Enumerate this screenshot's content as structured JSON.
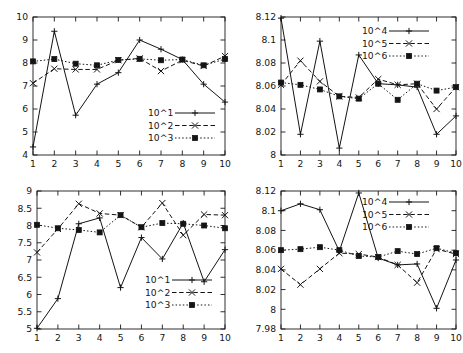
{
  "figure": {
    "title": "",
    "panel_count": 4
  },
  "chart_data": [
    {
      "id": "top-left",
      "type": "line",
      "title": "",
      "xlabel": "",
      "ylabel": "",
      "x": [
        1,
        2,
        3,
        4,
        5,
        6,
        7,
        8,
        9,
        10
      ],
      "xlim": [
        1,
        10
      ],
      "ylim": [
        4,
        10
      ],
      "yticks": [
        4,
        5,
        6,
        7,
        8,
        9,
        10
      ],
      "ytick_labels": [
        "4",
        "5",
        "6",
        "7",
        "8",
        "9",
        "10"
      ],
      "xticks": [
        1,
        2,
        3,
        4,
        5,
        6,
        7,
        8,
        9,
        10
      ],
      "xtick_labels": [
        "1",
        "2",
        "3",
        "4",
        "5",
        "6",
        "7",
        "8",
        "9",
        "10"
      ],
      "grid": false,
      "legend_position": "lower-right",
      "series": [
        {
          "name": "10^1",
          "marker": "plus",
          "line": "solid",
          "values": [
            4.35,
            9.38,
            5.73,
            7.08,
            7.58,
            9.0,
            8.6,
            8.15,
            7.08,
            6.3
          ]
        },
        {
          "name": "10^2",
          "marker": "cross",
          "line": "dashed",
          "values": [
            7.12,
            7.75,
            7.72,
            7.72,
            8.12,
            8.2,
            7.65,
            8.12,
            7.87,
            8.3
          ]
        },
        {
          "name": "10^3",
          "marker": "square",
          "line": "dotted",
          "values": [
            8.07,
            8.17,
            7.97,
            7.9,
            8.13,
            8.18,
            8.12,
            8.15,
            7.9,
            8.17
          ]
        }
      ]
    },
    {
      "id": "top-right",
      "type": "line",
      "title": "",
      "xlabel": "",
      "ylabel": "",
      "x": [
        1,
        2,
        3,
        4,
        5,
        6,
        7,
        8,
        9,
        10
      ],
      "xlim": [
        1,
        10
      ],
      "ylim": [
        8,
        8.12
      ],
      "yticks": [
        8,
        8.02,
        8.04,
        8.06,
        8.08,
        8.1,
        8.12
      ],
      "ytick_labels": [
        "8",
        "8.02",
        "8.04",
        "8.06",
        "8.08",
        "8.1",
        "8.12"
      ],
      "xticks": [
        1,
        2,
        3,
        4,
        5,
        6,
        7,
        8,
        9,
        10
      ],
      "xtick_labels": [
        "1",
        "2",
        "3",
        "4",
        "5",
        "6",
        "7",
        "8",
        "9",
        "10"
      ],
      "grid": false,
      "legend_position": "upper-right",
      "series": [
        {
          "name": "10^4",
          "marker": "plus",
          "line": "solid",
          "values": [
            8.119,
            8.018,
            8.099,
            8.006,
            8.087,
            8.062,
            8.061,
            8.059,
            8.018,
            8.034
          ]
        },
        {
          "name": "10^5",
          "marker": "cross",
          "line": "dashed",
          "values": [
            8.061,
            8.082,
            8.064,
            8.051,
            8.05,
            8.066,
            8.061,
            8.062,
            8.04,
            8.059
          ]
        },
        {
          "name": "10^6",
          "marker": "square",
          "line": "dotted",
          "values": [
            8.063,
            8.061,
            8.057,
            8.051,
            8.049,
            8.062,
            8.048,
            8.062,
            8.056,
            8.059
          ]
        }
      ]
    },
    {
      "id": "bottom-left",
      "type": "line",
      "title": "",
      "xlabel": "",
      "ylabel": "",
      "x": [
        1,
        2,
        3,
        4,
        5,
        6,
        7,
        8,
        9,
        10
      ],
      "xlim": [
        1,
        10
      ],
      "ylim": [
        5,
        9
      ],
      "yticks": [
        5,
        5.5,
        6,
        6.5,
        7,
        7.5,
        8,
        8.5,
        9
      ],
      "ytick_labels": [
        "5",
        "5.5",
        "6",
        "6.5",
        "7",
        "7.5",
        "8",
        "8.5",
        "9"
      ],
      "xticks": [
        1,
        2,
        3,
        4,
        5,
        6,
        7,
        8,
        9,
        10
      ],
      "xtick_labels": [
        "1",
        "2",
        "3",
        "4",
        "5",
        "6",
        "7",
        "8",
        "9",
        "10"
      ],
      "grid": false,
      "legend_position": "lower-right",
      "series": [
        {
          "name": "10^1",
          "marker": "plus",
          "line": "solid",
          "values": [
            5.02,
            5.88,
            8.05,
            8.22,
            6.2,
            7.65,
            7.03,
            8.07,
            6.37,
            7.3
          ]
        },
        {
          "name": "10^2",
          "marker": "cross",
          "line": "dashed",
          "values": [
            7.22,
            7.9,
            8.63,
            8.35,
            8.3,
            7.95,
            8.65,
            7.72,
            8.32,
            8.3
          ]
        },
        {
          "name": "10^3",
          "marker": "square",
          "line": "dotted",
          "values": [
            8.02,
            7.92,
            7.87,
            7.8,
            8.3,
            7.95,
            8.07,
            8.05,
            8.0,
            7.92
          ]
        }
      ]
    },
    {
      "id": "bottom-right",
      "type": "line",
      "title": "",
      "xlabel": "",
      "ylabel": "",
      "x": [
        1,
        2,
        3,
        4,
        5,
        6,
        7,
        8,
        9,
        10
      ],
      "xlim": [
        1,
        10
      ],
      "ylim": [
        7.98,
        8.12
      ],
      "yticks": [
        7.98,
        8,
        8.02,
        8.04,
        8.06,
        8.08,
        8.1,
        8.12
      ],
      "ytick_labels": [
        "7.98",
        "8",
        "8.02",
        "8.04",
        "8.06",
        "8.08",
        "8.1",
        "8.12"
      ],
      "xticks": [
        1,
        2,
        3,
        4,
        5,
        6,
        7,
        8,
        9,
        10
      ],
      "xtick_labels": [
        "1",
        "2",
        "3",
        "4",
        "5",
        "6",
        "7",
        "8",
        "9",
        "10"
      ],
      "grid": false,
      "legend_position": "upper-right",
      "series": [
        {
          "name": "10^4",
          "marker": "plus",
          "line": "solid",
          "values": [
            8.1,
            8.107,
            8.101,
            8.059,
            8.118,
            8.052,
            8.045,
            8.046,
            8.001,
            8.05
          ]
        },
        {
          "name": "10^5",
          "marker": "cross",
          "line": "dashed",
          "values": [
            8.041,
            8.025,
            8.041,
            8.057,
            8.056,
            8.053,
            8.045,
            8.027,
            8.061,
            8.056
          ]
        },
        {
          "name": "10^6",
          "marker": "square",
          "line": "dotted",
          "values": [
            8.06,
            8.061,
            8.063,
            8.06,
            8.054,
            8.053,
            8.059,
            8.056,
            8.062,
            8.057
          ]
        }
      ]
    }
  ]
}
